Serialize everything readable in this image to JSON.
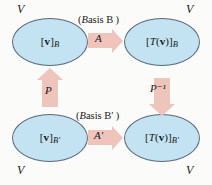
{
  "diagram": {
    "colors": {
      "ellipse_fill": "#c3e3f2",
      "ellipse_stroke": "#5a6b78",
      "arrow_fill": "#eec4bb",
      "text": "#18181a",
      "background": "#fbfbfa"
    },
    "nodes": [
      {
        "id": "top-left",
        "label": "[v]B",
        "space": "V"
      },
      {
        "id": "top-right",
        "label": "[T(v)]B",
        "space": "V"
      },
      {
        "id": "bottom-left",
        "label": "[v]B′",
        "space": "V"
      },
      {
        "id": "bottom-right",
        "label": "[T(v)]B′",
        "space": "V"
      }
    ],
    "space_markers": {
      "top_left": "V",
      "top_right": "V",
      "bottom_left": "V",
      "bottom_right": "V"
    },
    "captions": {
      "top": "(Basis B )",
      "bottom": "(Basis B′ )"
    },
    "arrows": [
      {
        "id": "top-horizontal",
        "label": "A",
        "direction": "right",
        "from": "top-left",
        "to": "top-right"
      },
      {
        "id": "bottom-horizontal",
        "label": "A′",
        "direction": "right",
        "from": "bottom-left",
        "to": "bottom-right"
      },
      {
        "id": "left-vertical",
        "label": "P",
        "direction": "up",
        "from": "bottom-left",
        "to": "top-left"
      },
      {
        "id": "right-vertical",
        "label": "P⁻¹",
        "direction": "down",
        "from": "top-right",
        "to": "bottom-right"
      }
    ]
  }
}
